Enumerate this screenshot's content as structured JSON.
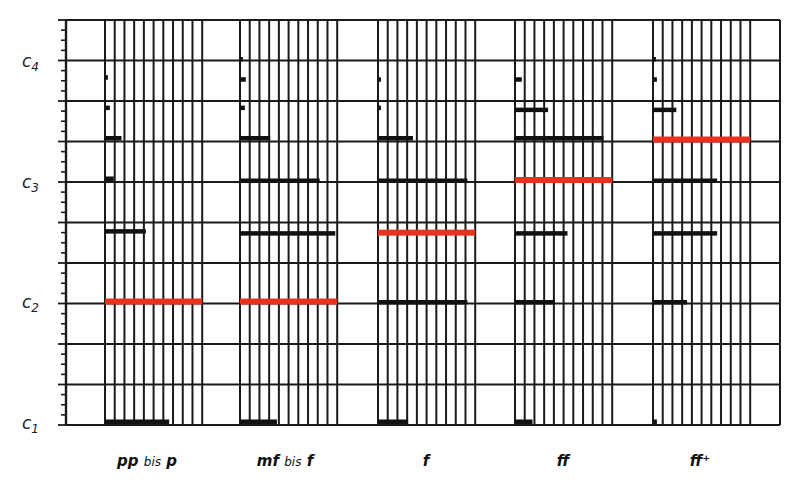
{
  "chart_data": {
    "type": "bar",
    "title": "",
    "xlabel": "",
    "ylabel": "",
    "y_axis": {
      "tick_labels": [
        {
          "label": "c",
          "sub": "1",
          "gridline": 0
        },
        {
          "label": "c",
          "sub": "2",
          "gridline": 3
        },
        {
          "label": "c",
          "sub": "3",
          "gridline": 6
        },
        {
          "label": "c",
          "sub": "4",
          "gridline": 9
        }
      ],
      "gridlines": 11,
      "minor_ticks_per_interval": 3,
      "range": [
        0,
        10
      ]
    },
    "grid": true,
    "columns_per_group": 10,
    "categories": [
      "pp bis p",
      "mf bis f",
      "f",
      "ff",
      "ff+"
    ],
    "category_labels": [
      {
        "main": "pp",
        "small": " bis ",
        "tail": "p"
      },
      {
        "main": "mf",
        "small": " bis ",
        "tail": "f"
      },
      {
        "main": "f",
        "small": "",
        "tail": ""
      },
      {
        "main": "ff",
        "small": "",
        "tail": ""
      },
      {
        "main": "ff⁺",
        "small": "",
        "tail": ""
      }
    ],
    "series": [
      {
        "name": "pp bis p",
        "bars": [
          {
            "level": 0.05,
            "width": 6.6,
            "highlight": false
          },
          {
            "level": 3.0,
            "width": 10.0,
            "highlight": true
          },
          {
            "level": 4.75,
            "width": 4.2,
            "highlight": false
          },
          {
            "level": 6.05,
            "width": 0.9,
            "highlight": false
          },
          {
            "level": 7.05,
            "width": 1.7,
            "highlight": false
          },
          {
            "level": 7.8,
            "width": 0.5,
            "highlight": false
          },
          {
            "level": 8.55,
            "width": 0.3,
            "highlight": false
          }
        ]
      },
      {
        "name": "mf bis f",
        "bars": [
          {
            "level": 0.05,
            "width": 3.8,
            "highlight": false
          },
          {
            "level": 3.0,
            "width": 10.0,
            "highlight": true
          },
          {
            "level": 4.7,
            "width": 9.8,
            "highlight": false
          },
          {
            "level": 6.0,
            "width": 8.2,
            "highlight": false
          },
          {
            "level": 7.05,
            "width": 3.1,
            "highlight": false
          },
          {
            "level": 7.8,
            "width": 0.5,
            "highlight": false
          },
          {
            "level": 8.5,
            "width": 0.6,
            "highlight": false
          },
          {
            "level": 9.0,
            "width": 0.3,
            "highlight": false
          }
        ]
      },
      {
        "name": "f",
        "bars": [
          {
            "level": 0.05,
            "width": 3.1,
            "highlight": false
          },
          {
            "level": 3.0,
            "width": 9.2,
            "highlight": false
          },
          {
            "level": 4.7,
            "width": 10.0,
            "highlight": true
          },
          {
            "level": 6.0,
            "width": 9.2,
            "highlight": false
          },
          {
            "level": 7.05,
            "width": 3.6,
            "highlight": false
          },
          {
            "level": 7.8,
            "width": 0.3,
            "highlight": false
          },
          {
            "level": 8.5,
            "width": 0.3,
            "highlight": false
          }
        ]
      },
      {
        "name": "ff",
        "bars": [
          {
            "level": 0.05,
            "width": 1.8,
            "highlight": false
          },
          {
            "level": 3.0,
            "width": 4.1,
            "highlight": false
          },
          {
            "level": 4.7,
            "width": 5.4,
            "highlight": false
          },
          {
            "level": 6.0,
            "width": 10.0,
            "highlight": true
          },
          {
            "level": 7.05,
            "width": 9.1,
            "highlight": false
          },
          {
            "level": 7.75,
            "width": 3.4,
            "highlight": false
          },
          {
            "level": 8.5,
            "width": 0.7,
            "highlight": false
          }
        ]
      },
      {
        "name": "ff+",
        "bars": [
          {
            "level": 0.05,
            "width": 0.4,
            "highlight": false
          },
          {
            "level": 3.0,
            "width": 3.5,
            "highlight": false
          },
          {
            "level": 4.7,
            "width": 6.6,
            "highlight": false
          },
          {
            "level": 6.0,
            "width": 6.6,
            "highlight": false
          },
          {
            "level": 7.0,
            "width": 10.0,
            "highlight": true
          },
          {
            "level": 7.75,
            "width": 2.4,
            "highlight": false
          },
          {
            "level": 8.5,
            "width": 0.4,
            "highlight": false
          },
          {
            "level": 9.0,
            "width": 0.3,
            "highlight": false
          }
        ]
      }
    ],
    "colors": {
      "grid": "#1a1a1a",
      "bar": "#111111",
      "highlight": "#e8321e",
      "background": "#ffffff"
    }
  },
  "axis_labels": {
    "c1": {
      "label": "c",
      "sub": "1"
    },
    "c2": {
      "label": "c",
      "sub": "2"
    },
    "c3": {
      "label": "c",
      "sub": "3"
    },
    "c4": {
      "label": "c",
      "sub": "4"
    }
  },
  "group_labels": {
    "g0": {
      "main": "pp",
      "small": "bis",
      "tail": "p"
    },
    "g1": {
      "main": "mf",
      "small": "bis",
      "tail": "f"
    },
    "g2": {
      "main": "f"
    },
    "g3": {
      "main": "ff"
    },
    "g4": {
      "main": "ff⁺"
    }
  }
}
